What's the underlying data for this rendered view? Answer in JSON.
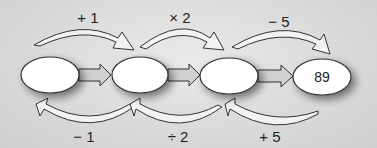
{
  "diagram": {
    "boxes": [
      {
        "id": "box1",
        "value": ""
      },
      {
        "id": "box2",
        "value": ""
      },
      {
        "id": "box3",
        "value": ""
      },
      {
        "id": "box4",
        "value": "89"
      }
    ],
    "top_operations": [
      "+ 1",
      "× 2",
      "− 5"
    ],
    "bottom_operations": [
      "− 1",
      "÷ 2",
      "+ 5"
    ],
    "colors": {
      "ellipse_fill": "#ffffff",
      "stroke": "#333333",
      "arrow_fill": "#d0d0d0",
      "background": "#d9d9d9"
    }
  }
}
